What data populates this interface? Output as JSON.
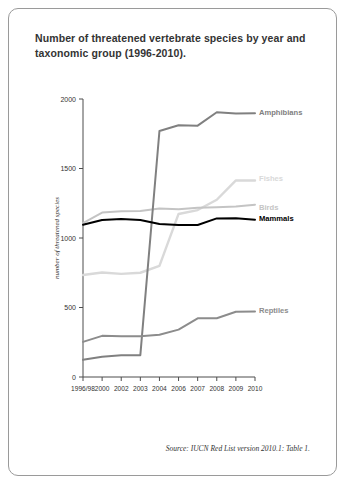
{
  "title": "Number of threatened vertebrate species by year and taxonomic group (1996-2010).",
  "source": "Source: IUCN Red List version 2010.1: Table 1.",
  "chart_data": {
    "type": "line",
    "title": "Number of threatened vertebrate species by year and taxonomic group (1996-2010).",
    "xlabel": "",
    "ylabel": "number of threatened species",
    "x": [
      "1996/98",
      "2000",
      "2002",
      "2003",
      "2004",
      "2006",
      "2007",
      "2008",
      "2009",
      "2010"
    ],
    "categories": [
      "1996/98",
      "2000",
      "2002",
      "2003",
      "2004",
      "2006",
      "2007",
      "2008",
      "2009",
      "2010"
    ],
    "ylim": [
      0,
      2000
    ],
    "yticks": [
      0,
      500,
      1000,
      1500,
      2000
    ],
    "grid": false,
    "legend_position": "inline-right",
    "series": [
      {
        "name": "Amphibians",
        "color": "#808080",
        "width": 2.0,
        "label_x": 2010,
        "label_y": 1900,
        "values": [
          124,
          146,
          157,
          157,
          1770,
          1811,
          1808,
          1905,
          1895,
          1898
        ]
      },
      {
        "name": "Fishes",
        "color": "#d9d9d9",
        "width": 2.4,
        "label_x": 2010,
        "label_y": 1430,
        "values": [
          734,
          752,
          742,
          750,
          800,
          1173,
          1201,
          1275,
          1414,
          1414
        ]
      },
      {
        "name": "Birds",
        "color": "#c4c4c4",
        "width": 2.0,
        "label_x": 2010,
        "label_y": 1220,
        "values": [
          1107,
          1183,
          1192,
          1194,
          1213,
          1206,
          1217,
          1222,
          1227,
          1240
        ]
      },
      {
        "name": "Mammals",
        "color": "#000000",
        "width": 2.0,
        "label_x": 2010,
        "label_y": 1140,
        "values": [
          1096,
          1130,
          1137,
          1130,
          1101,
          1093,
          1094,
          1141,
          1142,
          1131
        ]
      },
      {
        "name": "Reptiles",
        "color": "#8c8c8c",
        "width": 2.0,
        "label_x": 2010,
        "label_y": 480,
        "values": [
          253,
          296,
          293,
          293,
          304,
          341,
          422,
          423,
          469,
          471
        ]
      }
    ]
  }
}
